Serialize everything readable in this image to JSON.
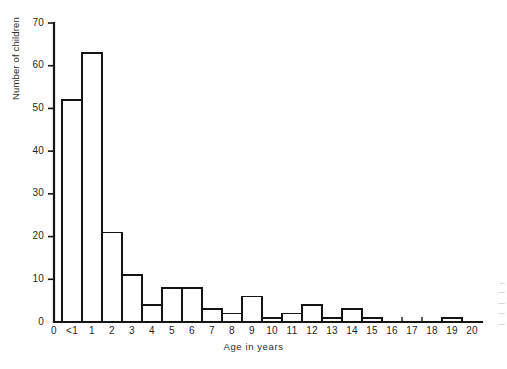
{
  "chart_data": {
    "type": "bar",
    "title": "",
    "subtitle": "",
    "xlabel": "Age in years",
    "ylabel": "Number of children",
    "categories": [
      "<1",
      "1",
      "2",
      "3",
      "4",
      "5",
      "6",
      "7",
      "8",
      "9",
      "10",
      "11",
      "12",
      "13",
      "14",
      "15",
      "16",
      "17",
      "18",
      "19",
      "20"
    ],
    "values": [
      52,
      63,
      21,
      11,
      4,
      8,
      8,
      3,
      2,
      6,
      1,
      2,
      4,
      1,
      3,
      1,
      0,
      0,
      0,
      1,
      0
    ],
    "ylim": [
      0,
      70
    ],
    "yticks": [
      0,
      10,
      20,
      30,
      40,
      50,
      60,
      70
    ],
    "ytick_labels": [
      "0",
      "10",
      "20",
      "30",
      "40",
      "50",
      "60",
      "70"
    ],
    "origin_label": "0",
    "grid": false,
    "legend": null,
    "legend_position": "none",
    "bar_fill": "#ffffff",
    "bar_stroke": "#141414",
    "axis_color": "#141414"
  },
  "figure": {
    "background": "#ffffff",
    "axis_label_color": "#2b2b2b"
  }
}
